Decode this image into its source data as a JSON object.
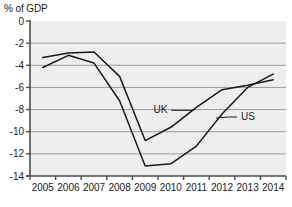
{
  "chart_data": {
    "type": "line",
    "title": "",
    "ylabel": "% of GDP",
    "xlabel": "",
    "grid": true,
    "legend_position": "inline-annotation",
    "ylim": [
      -14,
      0
    ],
    "yticks": [
      0,
      -2,
      -4,
      -6,
      -8,
      -10,
      -12,
      -14
    ],
    "ytick_labels": [
      "0",
      "-2",
      "-4",
      "-6",
      "-8",
      "-10",
      "-12",
      "-14"
    ],
    "categories": [
      "2005",
      "2006",
      "2007",
      "2008",
      "2009",
      "2010",
      "2011",
      "2012",
      "2013",
      "2014"
    ],
    "x": [
      2005,
      2006,
      2007,
      2008,
      2009,
      2010,
      2011,
      2012,
      2013,
      2014
    ],
    "series": [
      {
        "name": "UK",
        "values": [
          -3.3,
          -2.9,
          -2.8,
          -5.0,
          -10.8,
          -9.6,
          -7.8,
          -6.2,
          -5.8,
          -5.3
        ],
        "color": "#1a1a1a"
      },
      {
        "name": "US",
        "values": [
          -4.2,
          -3.1,
          -3.8,
          -7.2,
          -13.1,
          -12.9,
          -11.3,
          -8.4,
          -6.0,
          -4.8
        ],
        "color": "#1a1a1a"
      }
    ],
    "annotations": [
      {
        "text": "UK",
        "series": "UK"
      },
      {
        "text": "US",
        "series": "US"
      }
    ]
  },
  "colors": {
    "plot_background": "#eeeeee",
    "gridline": "#9a9a9a",
    "axis": "#4d4d4d",
    "line": "#1a1a1a",
    "text": "#1a1a1a",
    "page_background": "#ffffff"
  }
}
